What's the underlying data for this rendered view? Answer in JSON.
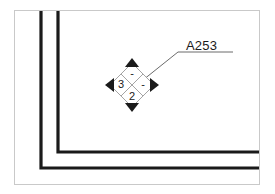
{
  "drawing": {
    "title": "Architectural plan corner with NFPA 704 hazard marker",
    "background_color": "#ffffff",
    "frame_color": "#c9c9c9",
    "line_color": "#1a1a1a"
  },
  "annotation": {
    "room_label": "A253",
    "leader_from": "diamond-upper-right",
    "leader_to": "label-a253"
  },
  "hazard_diamond": {
    "name": "nfpa-704-diamond",
    "quadrants": {
      "top": "-",
      "left": "3",
      "right": "-",
      "bottom": "2"
    },
    "top_label": "-",
    "left_label": "3",
    "right_label": "-",
    "bottom_label": "2",
    "tips": {
      "top": "filled-triangle",
      "left": "filled-triangle",
      "right": "filled-triangle",
      "bottom": "filled-triangle"
    }
  },
  "walls": [
    {
      "name": "inner-wall",
      "description": "vertical down then bends right at lower-left corner"
    },
    {
      "name": "outer-wall",
      "description": "vertical down then bends right at lower-left corner, offset outward"
    }
  ]
}
